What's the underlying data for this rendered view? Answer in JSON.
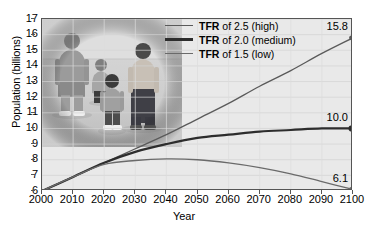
{
  "chart_data": {
    "type": "line",
    "title": "",
    "xlabel": "Year",
    "ylabel": "Population (billions)",
    "xlim": [
      2000,
      2100
    ],
    "ylim": [
      6,
      17
    ],
    "grid": true,
    "legend_position": "top-center",
    "xticks": [
      "2000",
      "2010",
      "2020",
      "2030",
      "2040",
      "2050",
      "2060",
      "2070",
      "2080",
      "2090",
      "2100"
    ],
    "yticks": [
      "17",
      "16",
      "15",
      "14",
      "13",
      "12",
      "11",
      "10",
      "9",
      "8",
      "7",
      "6"
    ],
    "x": [
      2000,
      2010,
      2020,
      2030,
      2040,
      2050,
      2060,
      2070,
      2080,
      2090,
      2100
    ],
    "series": [
      {
        "name": "TFR of 2.5 (high)",
        "legend_bold": "TFR",
        "legend_rest": " of 2.5 (high)",
        "values": [
          6.0,
          6.9,
          7.8,
          8.7,
          9.6,
          10.6,
          11.6,
          12.7,
          13.7,
          14.8,
          15.8
        ],
        "end_label": "15.8",
        "color": "#5a5a5a",
        "width": 1.3
      },
      {
        "name": "TFR of 2.0 (medium)",
        "legend_bold": "TFR",
        "legend_rest": " of 2.0 (medium)",
        "values": [
          6.0,
          6.9,
          7.8,
          8.5,
          9.0,
          9.4,
          9.6,
          9.8,
          9.9,
          10.0,
          10.0
        ],
        "end_label": "10.0",
        "color": "#2d2d2d",
        "width": 2.2
      },
      {
        "name": "TFR of 1.5 (low)",
        "legend_bold": "TFR",
        "legend_rest": " of 1.5 (low)",
        "values": [
          6.0,
          6.9,
          7.7,
          7.95,
          8.05,
          8.0,
          7.8,
          7.5,
          7.1,
          6.6,
          6.1
        ],
        "end_label": "6.1",
        "color": "#6a6a6a",
        "width": 1.3
      }
    ],
    "annotations": [
      {
        "text": "15.8",
        "at_x": 2100,
        "at_y": 15.8
      },
      {
        "text": "10.0",
        "at_x": 2100,
        "at_y": 10.0
      },
      {
        "text": "6.1",
        "at_x": 2100,
        "at_y": 6.1
      }
    ],
    "photo_caption": "family of four walking"
  }
}
